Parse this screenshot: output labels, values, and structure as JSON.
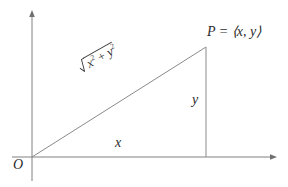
{
  "figure": {
    "background_color": "#ffffff",
    "stroke_color": "#808080",
    "text_color": "#2b2b2b",
    "width": 288,
    "height": 187
  },
  "axes": {
    "origin_label": "O",
    "x_axis": {
      "name": "horizontal-axis",
      "x_start": 12,
      "x_end": 277,
      "y": 157,
      "arrow": "right"
    },
    "y_axis": {
      "name": "vertical-axis",
      "x": 32,
      "y_start": 181,
      "y_end": 10,
      "arrow": "up"
    }
  },
  "triangle": {
    "origin": {
      "x": 32,
      "y": 157
    },
    "apex": {
      "x": 206,
      "y": 47
    },
    "foot": {
      "x": 206,
      "y": 157
    }
  },
  "labels": {
    "point": "P = ⟨x, y⟩",
    "point_name": "P",
    "point_equals": "=",
    "point_vector": "⟨x, y⟩",
    "horizontal_leg": "x",
    "vertical_leg": "y",
    "hypotenuse_base": "x",
    "hypotenuse_exp1": "2",
    "hypotenuse_plus": "+",
    "hypotenuse_var2": "y",
    "hypotenuse_exp2": "2",
    "hypotenuse_full": "√(x² + y²)"
  }
}
